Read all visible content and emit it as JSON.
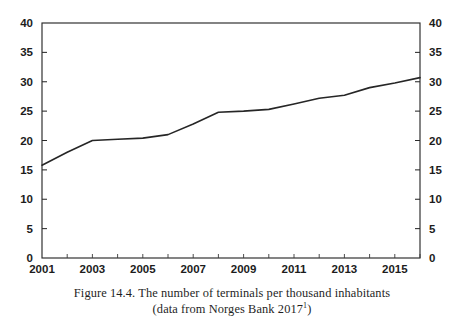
{
  "figure": {
    "caption_line1": "Figure 14.4. The number of terminals per thousand inhabitants",
    "caption_line2_prefix": "(data from Norges Bank 2017",
    "caption_footnote_marker": "1",
    "caption_line2_suffix": ")"
  },
  "chart_data": {
    "type": "line",
    "title": "",
    "xlabel": "",
    "ylabel": "",
    "xlim": [
      2001,
      2016
    ],
    "ylim": [
      0,
      40
    ],
    "grid": false,
    "legend": "none",
    "dual_y_axis": true,
    "x": [
      2001,
      2002,
      2003,
      2004,
      2005,
      2006,
      2007,
      2008,
      2009,
      2010,
      2011,
      2012,
      2013,
      2014,
      2015,
      2016
    ],
    "values": [
      15.8,
      18.0,
      20.0,
      20.2,
      20.4,
      21.0,
      22.8,
      24.8,
      25.0,
      25.3,
      26.2,
      27.2,
      27.7,
      29.0,
      29.8,
      30.7
    ],
    "series": [
      {
        "name": "terminals per thousand inhabitants",
        "color": "#262626",
        "values": [
          15.8,
          18.0,
          20.0,
          20.2,
          20.4,
          21.0,
          22.8,
          24.8,
          25.0,
          25.3,
          26.2,
          27.2,
          27.7,
          29.0,
          29.8,
          30.7
        ]
      }
    ],
    "y_ticks": [
      0,
      5,
      10,
      15,
      20,
      25,
      30,
      35,
      40
    ],
    "y_tick_labels_left": [
      "0",
      "5",
      "10",
      "15",
      "20",
      "25",
      "30",
      "35",
      "40"
    ],
    "y_tick_labels_right": [
      "0",
      "5",
      "10",
      "15",
      "20",
      "25",
      "30",
      "35",
      "40"
    ],
    "x_ticks": [
      2001,
      2002,
      2003,
      2004,
      2005,
      2006,
      2007,
      2008,
      2009,
      2010,
      2011,
      2012,
      2013,
      2014,
      2015,
      2016
    ],
    "x_tick_labels": [
      "2001",
      "",
      "2003",
      "",
      "2005",
      "",
      "2007",
      "",
      "2009",
      "",
      "2011",
      "",
      "2013",
      "",
      "2015",
      ""
    ],
    "x_labeled_ticks": [
      "2001",
      "2003",
      "2005",
      "2007",
      "2009",
      "2011",
      "2013",
      "2015"
    ]
  },
  "colors": {
    "line": "#262626",
    "axis": "#2a2a2a",
    "text": "#1c1c1c",
    "background": "#ffffff"
  }
}
